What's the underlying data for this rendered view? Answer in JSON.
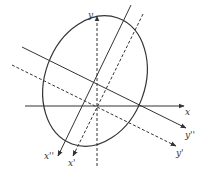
{
  "diagram": {
    "colors": {
      "stroke": "#333333",
      "background": "#ffffff"
    },
    "ellipse": {
      "cx": 95,
      "cy": 81,
      "rx": 50,
      "ry": 67,
      "rotation": 20
    },
    "axes": [
      {
        "id": "x",
        "label": "x",
        "style": "solid",
        "x1": 25,
        "y1": 106,
        "x2": 184,
        "y2": 106,
        "label_x": 185,
        "label_y": 115
      },
      {
        "id": "y",
        "label": "y",
        "style": "dashed",
        "x1": 97,
        "y1": 166,
        "x2": 97,
        "y2": 16,
        "label_x": 88,
        "label_y": 18
      },
      {
        "id": "x2",
        "label": "x''",
        "style": "solid",
        "x1": 131,
        "y1": 5,
        "x2": 58,
        "y2": 156,
        "label_x": 44,
        "label_y": 159
      },
      {
        "id": "y2",
        "label": "y''",
        "style": "solid",
        "x1": 22,
        "y1": 47,
        "x2": 186,
        "y2": 128,
        "label_x": 185,
        "label_y": 138
      },
      {
        "id": "x1",
        "label": "x'",
        "style": "dashed",
        "x1": 143,
        "y1": 14,
        "x2": 73,
        "y2": 156,
        "label_x": 68,
        "label_y": 166
      },
      {
        "id": "y1",
        "label": "y'",
        "style": "dashed",
        "x1": 12,
        "y1": 65,
        "x2": 176,
        "y2": 146,
        "label_x": 176,
        "label_y": 156
      }
    ]
  }
}
